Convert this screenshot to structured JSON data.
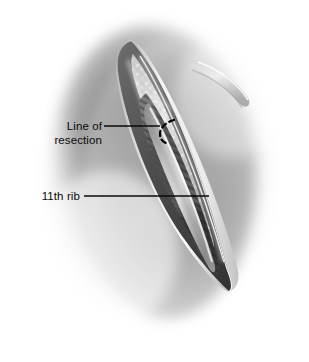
{
  "figure": {
    "background_color": "#ffffff",
    "ink_color": "#0a0a0a",
    "tone": {
      "skin_light": "#d8d8d8",
      "skin_mid": "#9a9a9a",
      "skin_shadow": "#6b6b6b",
      "vignette": "#5a5a5a",
      "wound_edge_highlight": "#f2f2f2",
      "fat_granule": "#e2e2e2",
      "muscle_mid": "#7c7c7c",
      "muscle_dark": "#4a4a4a",
      "cavity_dark": "#3a3a3a",
      "rib_light": "#c9c9c9"
    }
  },
  "labels": [
    {
      "id": "line-of-resection",
      "text": "Line of\nresection",
      "text_x": 28,
      "text_y": 119,
      "leader": {
        "x1": 104,
        "y1": 126,
        "x2": 160,
        "y2": 126
      },
      "pointer": "dashed-arc"
    },
    {
      "id": "eleventh-rib",
      "text": "11th rib",
      "text_x": 28,
      "text_y": 189,
      "leader": {
        "x1": 84,
        "y1": 196,
        "x2": 209,
        "y2": 196
      },
      "pointer": "line-end"
    }
  ],
  "annotations": {
    "resection_arc": {
      "name": "dashed-resection-arc",
      "description": "short dashed curved mark across the rib surface",
      "dash_pattern": "5 4"
    }
  },
  "anatomy": [
    {
      "name": "skin-surface",
      "description": "surrounding flank skin with soft radial vignette"
    },
    {
      "name": "incision-opening",
      "description": "elongated lens-shaped wound, apex upper-left, tip lower-right"
    },
    {
      "name": "wound-edge-left",
      "description": "retracted skin and subcutaneous edge with bright highlight rim"
    },
    {
      "name": "wound-edge-right",
      "description": "retracted skin and subcutaneous edge with bright highlight rim"
    },
    {
      "name": "subcutaneous-fat",
      "description": "granular pale tissue lining the wound margins"
    },
    {
      "name": "eleventh-rib",
      "description": "central pale rib shaft running along the wound axis"
    },
    {
      "name": "intercostal-muscle",
      "description": "striated muscle fibres crossing obliquely in the depth"
    },
    {
      "name": "muscle-band-crossing",
      "description": "fascial/muscle band crossing the upper-right of the field"
    },
    {
      "name": "wound-depth-cavity",
      "description": "darkest recess below the rib in the lower wound"
    }
  ]
}
